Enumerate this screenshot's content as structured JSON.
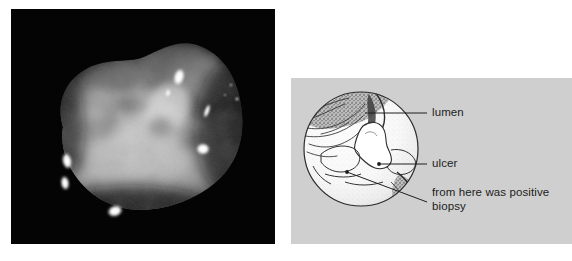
{
  "figure": {
    "panels": [
      {
        "id": "endoscopic-photograph",
        "type": "photograph",
        "description": "Black-background endoscopic photograph of a gastric ulcer with irregular nodular mucosa and bright specular light reflections"
      },
      {
        "id": "schematic-diagram",
        "type": "line-drawing",
        "description": "Grey-background circular schematic line drawing annotating the endoscopic photograph"
      }
    ]
  },
  "diagram": {
    "background_color": "#cfcfcf",
    "circle": {
      "stroke_color": "#2b2b2b",
      "fill_color": "#fbfbfb"
    },
    "labels": [
      {
        "id": "lumen",
        "text": "lumen"
      },
      {
        "id": "ulcer",
        "text": "ulcer"
      },
      {
        "id": "biopsy_line1",
        "text": "from here was positive"
      },
      {
        "id": "biopsy_line2",
        "text": "biopsy"
      }
    ]
  },
  "colors": {
    "photo_background": "#050505",
    "diagram_background": "#cfcfcf",
    "page_background": "#ffffff",
    "ink": "#1b1b1b"
  }
}
